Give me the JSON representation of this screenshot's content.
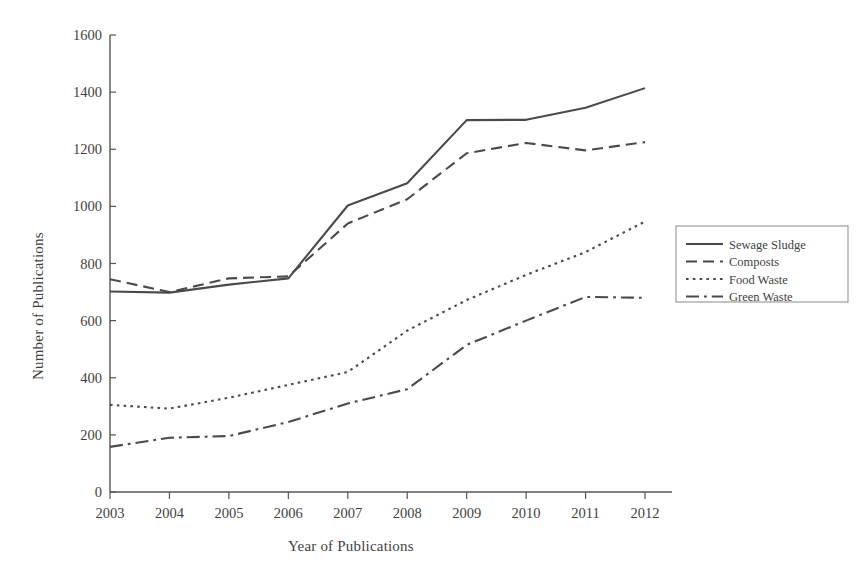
{
  "chart_data": {
    "type": "line",
    "title": "",
    "xlabel": "Year of Publications",
    "ylabel": "Number of Publications",
    "categories": [
      "2003",
      "2004",
      "2005",
      "2006",
      "2007",
      "2008",
      "2009",
      "2010",
      "2011",
      "2012"
    ],
    "x": [
      2003,
      2004,
      2005,
      2006,
      2007,
      2008,
      2009,
      2010,
      2011,
      2012
    ],
    "xlim": [
      2003,
      2012
    ],
    "ylim": [
      0,
      1600
    ],
    "yticks": [
      0,
      200,
      400,
      600,
      800,
      1000,
      1200,
      1400,
      1600
    ],
    "xticks": [
      2003,
      2004,
      2005,
      2006,
      2007,
      2008,
      2009,
      2010,
      2011,
      2012
    ],
    "grid": false,
    "legend_position": "right",
    "line_color": "#4a4a4a",
    "series": [
      {
        "name": "Sewage Sludge",
        "style": "solid",
        "values": [
          702,
          698,
          726,
          748,
          1003,
          1081,
          1302,
          1303,
          1345,
          1414
        ]
      },
      {
        "name": "Composts",
        "style": "dashed",
        "values": [
          745,
          700,
          748,
          755,
          940,
          1025,
          1186,
          1222,
          1196,
          1225
        ]
      },
      {
        "name": "Food Waste",
        "style": "dotted",
        "values": [
          305,
          292,
          330,
          375,
          420,
          565,
          672,
          760,
          840,
          947
        ]
      },
      {
        "name": "Green Waste",
        "style": "dashdot",
        "values": [
          158,
          190,
          196,
          245,
          310,
          360,
          515,
          600,
          683,
          680
        ]
      }
    ]
  },
  "legend": {
    "items": [
      {
        "label": "Sewage Sludge",
        "style": "solid"
      },
      {
        "label": "Composts",
        "style": "dashed"
      },
      {
        "label": "Food Waste",
        "style": "dotted"
      },
      {
        "label": "Green Waste",
        "style": "dashdot"
      }
    ]
  }
}
